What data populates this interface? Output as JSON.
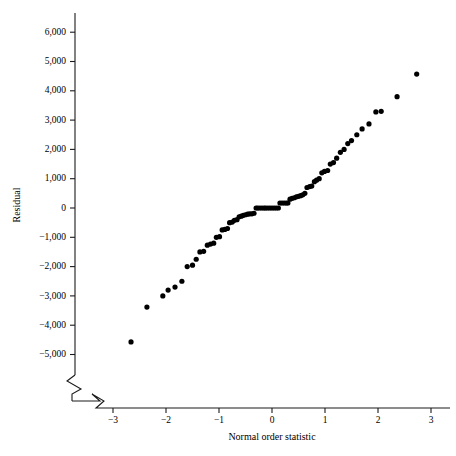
{
  "chart_data": {
    "type": "scatter",
    "title": "",
    "xlabel": "Normal order statistic",
    "ylabel": "Residual",
    "xlim": [
      -3.45,
      3.45
    ],
    "ylim": [
      -5600,
      6600
    ],
    "grid": false,
    "legend": null,
    "axis_break": {
      "x_axis": true,
      "y_axis": true,
      "note": "zigzag break marks near origin corner"
    },
    "xticks": [
      -3,
      -2,
      -1,
      0,
      1,
      2,
      3
    ],
    "xtick_labels": [
      "−3",
      "−2",
      "−1",
      "0",
      "1",
      "2",
      "3"
    ],
    "yticks": [
      -5000,
      -4000,
      -3000,
      -2000,
      -1000,
      0,
      1000,
      2000,
      3000,
      4000,
      5000,
      6000
    ],
    "ytick_labels": [
      "−5,000",
      "−4,000",
      "−3,000",
      "−2,000",
      "−1,000",
      "0",
      "1,000",
      "2,000",
      "3,000",
      "4,000",
      "5,000",
      "6,000"
    ],
    "marker": {
      "shape": "circle",
      "size": 2.6,
      "color": "#000000"
    },
    "x": [
      -2.66,
      -2.36,
      -2.06,
      -1.96,
      -1.83,
      -1.7,
      -1.6,
      -1.5,
      -1.43,
      -1.36,
      -1.29,
      -1.22,
      -1.16,
      -1.1,
      -1.05,
      -0.99,
      -0.94,
      -0.89,
      -0.84,
      -0.8,
      -0.75,
      -0.71,
      -0.66,
      -0.62,
      -0.58,
      -0.54,
      -0.5,
      -0.46,
      -0.42,
      -0.38,
      -0.34,
      -0.3,
      -0.27,
      -0.23,
      -0.19,
      -0.15,
      -0.12,
      -0.08,
      -0.04,
      0.0,
      0.04,
      0.08,
      0.12,
      0.15,
      0.19,
      0.23,
      0.27,
      0.3,
      0.34,
      0.38,
      0.42,
      0.46,
      0.5,
      0.54,
      0.58,
      0.62,
      0.66,
      0.71,
      0.75,
      0.8,
      0.84,
      0.89,
      0.94,
      0.99,
      1.05,
      1.1,
      1.16,
      1.22,
      1.29,
      1.36,
      1.43,
      1.5,
      1.6,
      1.7,
      1.83,
      1.96,
      2.06,
      2.36,
      2.73
    ],
    "y": [
      -4570,
      -3380,
      -3000,
      -2800,
      -2700,
      -2500,
      -2000,
      -1950,
      -1750,
      -1500,
      -1480,
      -1270,
      -1230,
      -1200,
      -1000,
      -980,
      -750,
      -730,
      -700,
      -500,
      -480,
      -420,
      -400,
      -300,
      -280,
      -250,
      -230,
      -210,
      -200,
      -200,
      -180,
      0,
      0,
      0,
      0,
      0,
      0,
      0,
      0,
      0,
      0,
      0,
      0,
      170,
      170,
      170,
      170,
      170,
      300,
      330,
      350,
      380,
      400,
      420,
      450,
      500,
      700,
      730,
      750,
      900,
      950,
      1000,
      1200,
      1250,
      1280,
      1500,
      1550,
      1700,
      1900,
      2000,
      2200,
      2300,
      2500,
      2700,
      2870,
      3280,
      3300,
      3800,
      4570
    ]
  }
}
